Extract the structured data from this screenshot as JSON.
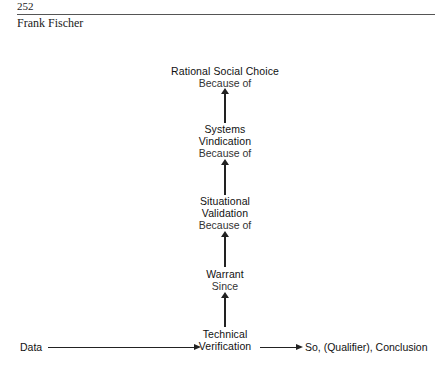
{
  "header": {
    "page_number": "252",
    "running_head": "Frank Fischer"
  },
  "diagram": {
    "nodes": [
      {
        "id": "rational-social-choice",
        "lines": [
          "Rational Social Choice"
        ],
        "connector": "Because of"
      },
      {
        "id": "systems-vindication",
        "lines": [
          "Systems",
          "Vindication"
        ],
        "connector": "Because of"
      },
      {
        "id": "situational-validation",
        "lines": [
          "Situational",
          "Validation"
        ],
        "connector": "Because of"
      },
      {
        "id": "warrant",
        "lines": [
          "Warrant"
        ],
        "connector": "Since"
      },
      {
        "id": "technical-verification",
        "lines": [
          "Technical",
          "Verification"
        ]
      }
    ],
    "data_label": "Data",
    "conclusion_label": "So, (Qualifier), Conclusion",
    "edges": [
      {
        "from": "systems-vindication",
        "to": "rational-social-choice",
        "direction": "up"
      },
      {
        "from": "situational-validation",
        "to": "systems-vindication",
        "direction": "up"
      },
      {
        "from": "warrant",
        "to": "situational-validation",
        "direction": "up"
      },
      {
        "from": "technical-verification",
        "to": "warrant",
        "direction": "up"
      },
      {
        "from": "data",
        "to": "technical-verification",
        "direction": "right"
      },
      {
        "from": "technical-verification",
        "to": "conclusion",
        "direction": "right"
      }
    ]
  }
}
